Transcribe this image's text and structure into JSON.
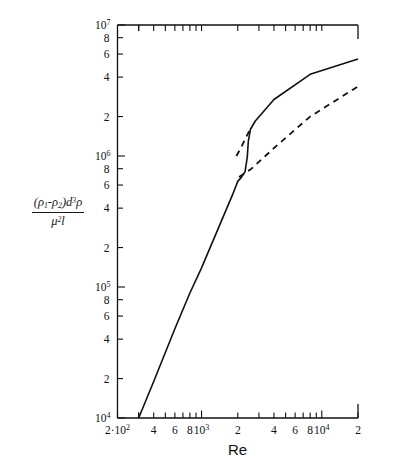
{
  "figure": {
    "xlabel": "Re",
    "ylabel_numerator_prefix": "(",
    "ylabel_numerator": "ρ",
    "ylabel_sub1": "1",
    "ylabel_minus": "-",
    "ylabel_rho2": "ρ",
    "ylabel_sub2": "2",
    "ylabel_close": ")d",
    "ylabel_dexp": "3",
    "ylabel_rho3": "ρ",
    "ylabel_denominator_mu": "μ",
    "ylabel_denominator_exp": "2",
    "ylabel_denominator_l": "l"
  },
  "chart_data": {
    "type": "line",
    "title": "",
    "xlabel": "Re",
    "ylabel": "(ρ₁-ρ₂)d³ρ / μ²l",
    "xscale": "log",
    "yscale": "log",
    "xlim": [
      200,
      20000
    ],
    "ylim": [
      10000,
      10000000
    ],
    "grid": false,
    "legend": "none",
    "x_tick_labels": [
      "2",
      "10²",
      "4",
      "6",
      "8",
      "10³",
      "2",
      "4",
      "6",
      "8",
      "10⁴",
      "2"
    ],
    "x_tick_values": [
      200,
      300,
      400,
      600,
      800,
      1000,
      2000,
      4000,
      6000,
      8000,
      10000,
      20000
    ],
    "y_tick_labels": [
      "10⁴",
      "2",
      "4",
      "6",
      "8",
      "10⁵",
      "2",
      "4",
      "6",
      "8",
      "10⁶",
      "2",
      "4",
      "6",
      "8",
      "10⁷"
    ],
    "y_tick_values": [
      10000,
      20000,
      40000,
      60000,
      80000,
      100000,
      200000,
      400000,
      600000,
      800000,
      1000000,
      2000000,
      4000000,
      6000000,
      8000000,
      10000000
    ],
    "series": [
      {
        "name": "solid-curve",
        "style": "solid",
        "color": "#111111",
        "points": [
          [
            300,
            10000
          ],
          [
            400,
            19000
          ],
          [
            600,
            48000
          ],
          [
            800,
            90000
          ],
          [
            1000,
            140000
          ],
          [
            1400,
            290000
          ],
          [
            1800,
            500000
          ],
          [
            2000,
            640000
          ],
          [
            2150,
            690000
          ],
          [
            2300,
            760000
          ],
          [
            2400,
            980000
          ],
          [
            2450,
            1300000
          ],
          [
            2550,
            1600000
          ],
          [
            2800,
            1850000
          ],
          [
            4000,
            2700000
          ],
          [
            8000,
            4200000
          ],
          [
            20000,
            5500000
          ]
        ]
      },
      {
        "name": "dashed-line-upper-stub",
        "style": "dashed",
        "color": "#111111",
        "points": [
          [
            1950,
            1000000
          ],
          [
            2150,
            1180000
          ],
          [
            2400,
            1450000
          ],
          [
            2550,
            1620000
          ]
        ]
      },
      {
        "name": "dashed-line-lower",
        "style": "dashed",
        "color": "#111111",
        "points": [
          [
            2050,
            690000
          ],
          [
            2600,
            800000
          ],
          [
            4000,
            1150000
          ],
          [
            8000,
            2000000
          ],
          [
            20000,
            3400000
          ]
        ]
      }
    ]
  }
}
